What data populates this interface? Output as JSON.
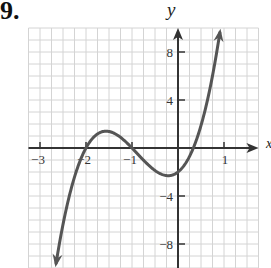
{
  "problem": {
    "number": "9."
  },
  "chart_data": {
    "type": "line",
    "title": "",
    "xlabel": "x",
    "ylabel": "y",
    "xlim": [
      -3.25,
      1.75
    ],
    "ylim": [
      -10,
      10
    ],
    "grid": true,
    "grid_step": {
      "x": 0.25,
      "y": 1
    },
    "x_ticks": [
      -3,
      -2,
      -1,
      1
    ],
    "x_tick_labels": [
      "−3",
      "−2",
      "−1",
      "1"
    ],
    "y_ticks": [
      8,
      4,
      -4,
      -8
    ],
    "y_tick_labels": [
      "8",
      "4",
      "−4",
      "−8"
    ],
    "series": [
      {
        "name": "f(x)",
        "description": "Cubic with roots at x = -2, x = -1, x ≈ 1/3; local max ≈ 1.3 near x ≈ -1.55; local min ≈ -2.3 near x ≈ -0.25; y-intercept -2; arrows at both ends",
        "x": [
          -2.65,
          -2.5,
          -2.25,
          -2.0,
          -1.75,
          -1.55,
          -1.25,
          -1.0,
          -0.75,
          -0.5,
          -0.25,
          0.0,
          0.33,
          0.5,
          0.75,
          0.91
        ],
        "y": [
          -9.6,
          -6.1,
          -2.0,
          0.0,
          1.0,
          1.4,
          0.9,
          0.0,
          -1.0,
          -1.9,
          -2.3,
          -2.0,
          0.0,
          1.7,
          5.3,
          9.6
        ]
      }
    ],
    "end_arrows": true
  },
  "labels": {
    "x_axis": "x",
    "y_axis": "y"
  },
  "colors": {
    "curve": "#555555",
    "axes": "#333333",
    "grid": "#d4d4d4"
  }
}
